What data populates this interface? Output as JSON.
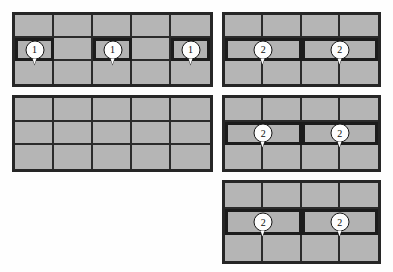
{
  "diagram": {
    "title": "",
    "background_color": "#fefefe",
    "cell_fill_color": "#b5b5b5",
    "grid_line_color": "#2b2b2b",
    "panel_border_color": "#262626",
    "marker_fill_color": "#fdfdfd",
    "marker_text_color": "#0d0d0d",
    "panels": [
      {
        "id": "panel-top-left",
        "name": "top-left-grid",
        "columns": 5,
        "rows": 3,
        "x": 12,
        "y": 12,
        "width": 201,
        "height": 75,
        "markers": [
          {
            "label": "1",
            "row": 2,
            "column": 1
          },
          {
            "label": "1",
            "row": 2,
            "column": 3
          },
          {
            "label": "1",
            "row": 2,
            "column": 5
          }
        ]
      },
      {
        "id": "panel-top-right",
        "name": "top-right-grid",
        "columns": 4,
        "rows": 3,
        "merged_row": 2,
        "merged_span": 2,
        "x": 222,
        "y": 12,
        "width": 159,
        "height": 75,
        "markers": [
          {
            "label": "2",
            "row": 2,
            "column": 1
          },
          {
            "label": "2",
            "row": 2,
            "column": 3
          }
        ]
      },
      {
        "id": "panel-middle-left",
        "name": "middle-left-grid",
        "columns": 5,
        "rows": 3,
        "x": 12,
        "y": 95,
        "width": 201,
        "height": 77,
        "markers": []
      },
      {
        "id": "panel-middle-right",
        "name": "middle-right-grid",
        "columns": 4,
        "rows": 3,
        "merged_row": 2,
        "merged_span": 2,
        "x": 222,
        "y": 95,
        "width": 159,
        "height": 77,
        "markers": [
          {
            "label": "2",
            "row": 2,
            "column": 1
          },
          {
            "label": "2",
            "row": 2,
            "column": 3
          }
        ]
      },
      {
        "id": "panel-bottom-right",
        "name": "bottom-right-grid",
        "columns": 4,
        "rows": 3,
        "merged_row": 2,
        "merged_span": 2,
        "x": 222,
        "y": 180,
        "width": 159,
        "height": 84,
        "markers": [
          {
            "label": "2",
            "row": 2,
            "column": 1
          },
          {
            "label": "2",
            "row": 2,
            "column": 3
          }
        ]
      }
    ]
  }
}
